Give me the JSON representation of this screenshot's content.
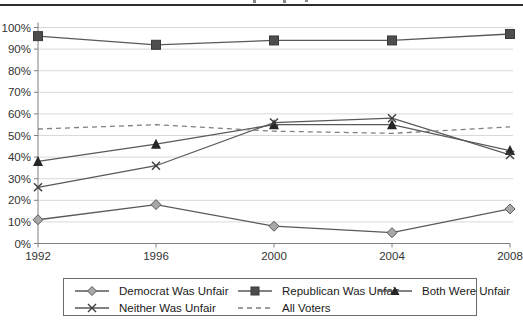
{
  "page": {
    "background": "#ffffff"
  },
  "header": {
    "top_rule_color": "#2e2e2e",
    "note": ""
  },
  "chart_data": {
    "type": "line",
    "title": "",
    "xlabel": "",
    "ylabel": "",
    "x_labels": [
      "1992",
      "1996",
      "2000",
      "2004",
      "2008"
    ],
    "y_tick_labels": [
      "0%",
      "10%",
      "20%",
      "30%",
      "40%",
      "50%",
      "60%",
      "70%",
      "80%",
      "90%",
      "100%"
    ],
    "ylim": [
      0,
      100
    ],
    "grid": "horizontal",
    "legend_position": "bottom-box",
    "series": [
      {
        "name": "Democrat Was Unfair",
        "marker": "diamond",
        "line": "solid",
        "marker_fill": "#a8a8a8",
        "values": [
          11,
          18,
          8,
          5,
          16
        ]
      },
      {
        "name": "Republican Was Unfair",
        "marker": "square",
        "line": "solid",
        "marker_fill": "#4d4d4d",
        "values": [
          96,
          92,
          94,
          94,
          97
        ]
      },
      {
        "name": "Both Were Unfair",
        "marker": "triangle",
        "line": "solid",
        "marker_fill": "#262626",
        "values": [
          38,
          46,
          55,
          55,
          43
        ]
      },
      {
        "name": "Neither Was Unfair",
        "marker": "x",
        "line": "solid",
        "marker_fill": "#3d3d3d",
        "values": [
          26,
          36,
          56,
          58,
          41
        ]
      },
      {
        "name": "All Voters",
        "marker": "none",
        "line": "dashed",
        "marker_fill": "#7f7f7f",
        "values": [
          53,
          55,
          52,
          51,
          54
        ]
      }
    ],
    "line_color": "#595959",
    "dashed_color": "#7f7f7f",
    "grid_color": "#d9d9d9",
    "axis_color": "#808080",
    "label_color": "#333333"
  }
}
